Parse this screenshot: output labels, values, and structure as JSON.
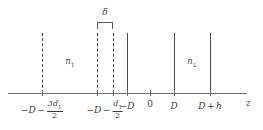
{
  "figure": {
    "type": "schematic-diagram",
    "axis": {
      "name": "z-axis",
      "label": "z",
      "x_start_px": 8,
      "x_end_px": 247,
      "y_px": 93
    },
    "regions": [
      {
        "id": "n1",
        "label": "n",
        "subscript": "1",
        "center_px": 70
      },
      {
        "id": "n2",
        "label": "n",
        "subscript": "2",
        "center_px": 192
      }
    ],
    "interfaces": [
      {
        "id": "line-1",
        "style": "dashed",
        "x_px": 42,
        "tick": "-D - 3d1/2"
      },
      {
        "id": "line-2",
        "style": "dashed",
        "x_px": 97,
        "tick": "-D - d1/2"
      },
      {
        "id": "line-3",
        "style": "dashed",
        "x_px": 113,
        "tick": ""
      },
      {
        "id": "line-4",
        "style": "solid",
        "x_px": 127,
        "tick": "-D"
      },
      {
        "id": "line-5",
        "style": "solid",
        "x_px": 174,
        "tick": "D"
      },
      {
        "id": "line-6",
        "style": "solid",
        "x_px": 210,
        "tick": "D + h"
      }
    ],
    "delta": {
      "symbol": "δ",
      "from_px": 97,
      "to_px": 113,
      "center_px": 105
    },
    "ticks": [
      {
        "id": "tick-minus-D-minus-3d1-over-2",
        "x_px": 42,
        "parts": {
          "lead": "−",
          "base": "D",
          "op": "−",
          "num": "3d",
          "num_sub": "1",
          "den": "2"
        }
      },
      {
        "id": "tick-minus-D-minus-d1-over-2",
        "x_px": 105,
        "parts": {
          "lead": "−",
          "base": "D",
          "op": "−",
          "num": "d",
          "num_sub": "1",
          "den": "2"
        }
      },
      {
        "id": "tick-minus-D",
        "x_px": 127,
        "text_lead": "−",
        "text_base": "D"
      },
      {
        "id": "tick-zero",
        "x_px": 150,
        "text_base": "0"
      },
      {
        "id": "tick-D",
        "x_px": 174,
        "text_base": "D"
      },
      {
        "id": "tick-D-plus-h",
        "x_px": 210,
        "text_base": "D",
        "text_op": "+",
        "text_tail": "h"
      }
    ],
    "colors": {
      "axis": "#6e6e6e",
      "lines": "#4a4a4a",
      "text": "#3a3a3a",
      "background": "#ffffff"
    }
  }
}
